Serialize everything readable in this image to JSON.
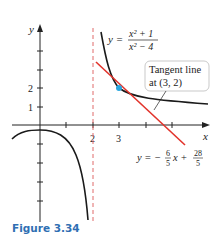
{
  "figure": {
    "caption": "Figure 3.34",
    "function_label": {
      "lhs": "y =",
      "numerator": "x² + 1",
      "denominator": "x² − 4"
    },
    "callout": {
      "line1": "Tangent line",
      "line2": "at (3, 2)"
    },
    "tangent_equation": {
      "lhs": "y = −",
      "frac1_num": "6",
      "frac1_den": "5",
      "mid": "x +",
      "frac2_num": "28",
      "frac2_den": "5"
    },
    "axes": {
      "x_label": "x",
      "y_label": "y",
      "x_ticks_labeled": [
        "2",
        "3"
      ],
      "y_ticks_labeled": [
        "1",
        "2"
      ]
    },
    "tangent_point": {
      "x": 3,
      "y": 2
    },
    "asymptote_x": 2,
    "colors": {
      "curve": "#1a1a1a",
      "tangent": "#e2332b",
      "asymptote": "#e06a6a",
      "point": "#2aa6df",
      "caption": "#2f6fb3"
    }
  }
}
